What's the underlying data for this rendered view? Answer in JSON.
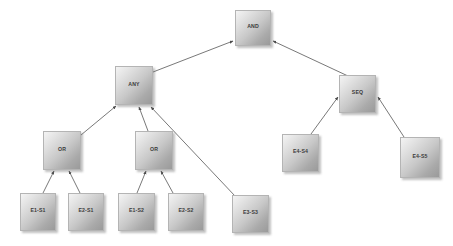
{
  "diagram": {
    "type": "attack-tree",
    "title": "",
    "background_color": "#ffffff",
    "node_fill_light": "#f4f4f4",
    "node_fill_dark": "#9a9a9a",
    "node_border_color": "#b4b4b4",
    "edge_color": "#555555",
    "label_color": "#3a3a3a",
    "nodes": [
      {
        "id": "and",
        "label": "AND",
        "x": 235,
        "y": 10,
        "w": 36,
        "h": 36,
        "kind": "operator"
      },
      {
        "id": "any",
        "label": "ANY",
        "x": 115,
        "y": 66,
        "w": 38,
        "h": 39,
        "kind": "operator"
      },
      {
        "id": "seq",
        "label": "SEQ",
        "x": 339,
        "y": 75,
        "w": 37,
        "h": 38,
        "kind": "operator"
      },
      {
        "id": "or1",
        "label": "OR",
        "x": 43,
        "y": 131,
        "w": 38,
        "h": 39,
        "kind": "operator"
      },
      {
        "id": "or2",
        "label": "OR",
        "x": 135,
        "y": 131,
        "w": 38,
        "h": 39,
        "kind": "operator"
      },
      {
        "id": "e4s4",
        "label": "E4-S4",
        "x": 282,
        "y": 134,
        "w": 37,
        "h": 38,
        "kind": "leaf"
      },
      {
        "id": "e4s5",
        "label": "E4-S5",
        "x": 400,
        "y": 137,
        "w": 40,
        "h": 41,
        "kind": "leaf"
      },
      {
        "id": "e1s1",
        "label": "E1-S1",
        "x": 20,
        "y": 193,
        "w": 36,
        "h": 38,
        "kind": "leaf"
      },
      {
        "id": "e2s1",
        "label": "E2-S1",
        "x": 68,
        "y": 193,
        "w": 36,
        "h": 38,
        "kind": "leaf"
      },
      {
        "id": "e1s2",
        "label": "E1-S2",
        "x": 118,
        "y": 193,
        "w": 37,
        "h": 38,
        "kind": "leaf"
      },
      {
        "id": "e2s2",
        "label": "E2-S2",
        "x": 168,
        "y": 193,
        "w": 36,
        "h": 38,
        "kind": "leaf"
      },
      {
        "id": "e3s3",
        "label": "E3-S3",
        "x": 232,
        "y": 195,
        "w": 37,
        "h": 38,
        "kind": "leaf"
      }
    ],
    "edges": [
      {
        "from": "any",
        "to": "and",
        "x1": 153,
        "y1": 72,
        "x2": 233,
        "y2": 41
      },
      {
        "from": "seq",
        "to": "and",
        "x1": 348,
        "y1": 76,
        "x2": 273,
        "y2": 41
      },
      {
        "from": "or1",
        "to": "any",
        "x1": 81,
        "y1": 135,
        "x2": 116,
        "y2": 106
      },
      {
        "from": "or2",
        "to": "any",
        "x1": 148,
        "y1": 131,
        "x2": 139,
        "y2": 107
      },
      {
        "from": "e3s3",
        "to": "any",
        "x1": 235,
        "y1": 196,
        "x2": 151,
        "y2": 107
      },
      {
        "from": "e1s1",
        "to": "or1",
        "x1": 43,
        "y1": 193,
        "x2": 54,
        "y2": 171
      },
      {
        "from": "e2s1",
        "to": "or1",
        "x1": 80,
        "y1": 193,
        "x2": 69,
        "y2": 171
      },
      {
        "from": "e1s2",
        "to": "or2",
        "x1": 137,
        "y1": 193,
        "x2": 146,
        "y2": 171
      },
      {
        "from": "e2s2",
        "to": "or2",
        "x1": 173,
        "y1": 193,
        "x2": 161,
        "y2": 171
      },
      {
        "from": "e4s4",
        "to": "seq",
        "x1": 311,
        "y1": 134,
        "x2": 338,
        "y2": 97
      },
      {
        "from": "e4s5",
        "to": "seq",
        "x1": 404,
        "y1": 137,
        "x2": 378,
        "y2": 97
      }
    ]
  }
}
